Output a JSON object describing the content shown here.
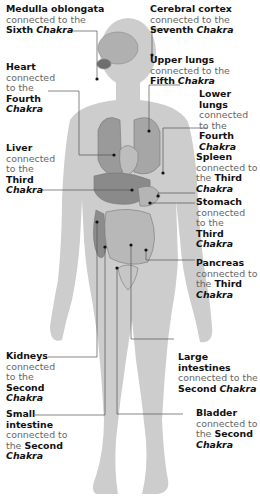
{
  "diagram": {
    "colors": {
      "skin": "#c8c8c8",
      "organs": "#8e8e8e",
      "lines": "#555555",
      "text": "#111111",
      "subtext": "#666666"
    },
    "labels": [
      {
        "organ": "Medulla oblongata",
        "connector": "connected to the",
        "chakra_number": "Sixth",
        "chakra_word": "Chakra"
      },
      {
        "organ": "Cerebral cortex",
        "connector": "connected to the",
        "chakra_number": "Seventh",
        "chakra_word": "Chakra"
      },
      {
        "organ": "Heart",
        "connector": "connected to the",
        "chakra_number": "Fourth",
        "chakra_word": "Chakra"
      },
      {
        "organ": "Upper lungs",
        "connector": "connected to the",
        "chakra_number": "Fifth",
        "chakra_word": "Chakra"
      },
      {
        "organ": "Lower lungs",
        "connector": "connected to the",
        "chakra_number": "Fourth",
        "chakra_word": "Chakra"
      },
      {
        "organ": "Liver",
        "connector": "connected to the",
        "chakra_number": "Third",
        "chakra_word": "Chakra"
      },
      {
        "organ": "Spleen",
        "connector": "connected to the",
        "chakra_number": "Third",
        "chakra_word": "Chakra"
      },
      {
        "organ": "Stomach",
        "connector": "connected to the",
        "chakra_number": "Third",
        "chakra_word": "Chakra"
      },
      {
        "organ": "Pancreas",
        "connector": "connected to the",
        "chakra_number": "Third",
        "chakra_word": "Chakra"
      },
      {
        "organ": "Kidneys",
        "connector": "connected to the",
        "chakra_number": "Second",
        "chakra_word": "Chakra"
      },
      {
        "organ": "Large intestines",
        "connector": "connected to the",
        "chakra_number": "Second",
        "chakra_word": "Chakra"
      },
      {
        "organ": "Small intestine",
        "connector": "connected to the",
        "chakra_number": "Second",
        "chakra_word": "Chakra"
      },
      {
        "organ": "Bladder",
        "connector": "connected to the",
        "chakra_number": "Second",
        "chakra_word": "Chakra"
      }
    ]
  }
}
